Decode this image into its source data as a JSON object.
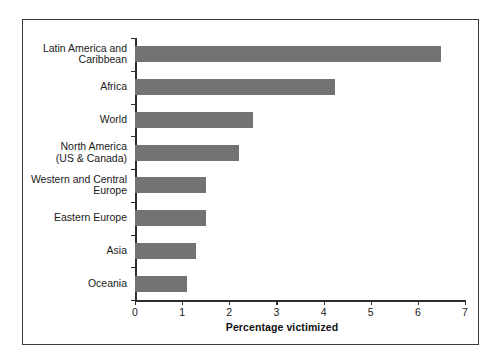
{
  "chart_data": {
    "type": "bar",
    "orientation": "horizontal",
    "title": "",
    "xlabel": "Percentage victimized",
    "ylabel": "",
    "xlim": [
      0,
      7
    ],
    "xticks": [
      "0",
      "1",
      "2",
      "3",
      "4",
      "5",
      "6",
      "7"
    ],
    "grid": false,
    "legend": null,
    "bar_color": "#737373",
    "categories": [
      "Latin America and\nCaribbean",
      "Africa",
      "World",
      "North America\n(US & Canada)",
      "Western and Central\nEurope",
      "Eastern Europe",
      "Asia",
      "Oceania"
    ],
    "values": [
      6.5,
      4.25,
      2.5,
      2.2,
      1.5,
      1.5,
      1.3,
      1.1
    ]
  }
}
